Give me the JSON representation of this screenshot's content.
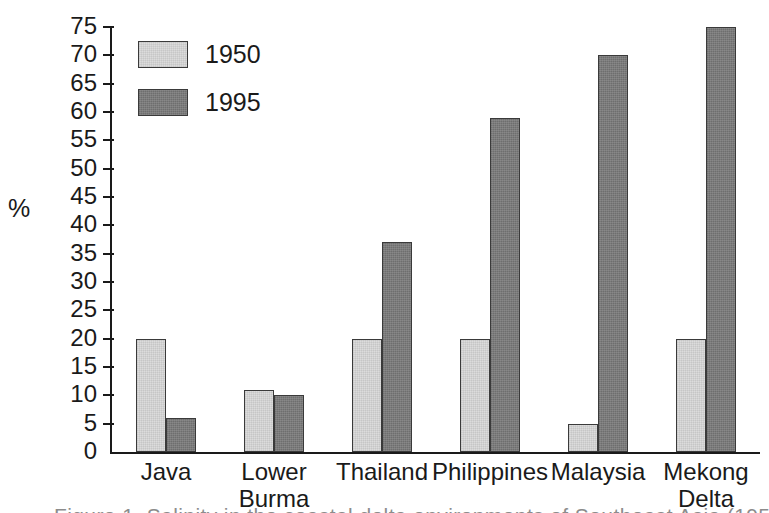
{
  "chart_data": {
    "type": "bar",
    "title": "",
    "xlabel": "",
    "ylabel": "%",
    "ylim": [
      0,
      75
    ],
    "ytick_step": 5,
    "grid": false,
    "legend_position": "top-left inside plot",
    "categories": [
      "Java",
      "Lower\nBurma",
      "Thailand",
      "Philippines",
      "Malaysia",
      "Mekong\nDelta"
    ],
    "series": [
      {
        "name": "1950",
        "color": "#dcdcdc",
        "values": [
          20,
          11,
          20,
          20,
          5,
          20
        ]
      },
      {
        "name": "1995",
        "color": "#7b7b7b",
        "values": [
          6,
          10,
          37,
          59,
          70,
          75
        ]
      }
    ],
    "ytick_labels": [
      "0",
      "5",
      "10",
      "15",
      "20",
      "25",
      "30",
      "35",
      "40",
      "45",
      "50",
      "55",
      "60",
      "65",
      "70",
      "75"
    ]
  },
  "axis": {
    "y_label": "%"
  },
  "legend": {
    "items": [
      {
        "label": "1950"
      },
      {
        "label": "1995"
      }
    ]
  },
  "caption_remnant": "Figure 1.  Salinity in the coastal delta environments of Southeast Asia (1950 and 1995)"
}
